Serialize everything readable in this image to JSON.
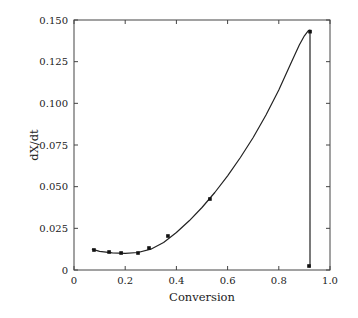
{
  "chart_data": {
    "type": "line",
    "title": "",
    "xlabel": "Conversion",
    "ylabel": "dX/dt",
    "xlim": [
      0,
      1.0
    ],
    "ylim": [
      0,
      0.15
    ],
    "grid": false,
    "legend": null,
    "x_ticks": [
      0,
      0.2,
      0.4,
      0.6,
      0.8,
      1.0
    ],
    "x_tick_labels": [
      "0",
      "0.2",
      "0.4",
      "0.6",
      "0.8",
      "1.0"
    ],
    "y_ticks": [
      0,
      0.025,
      0.05,
      0.075,
      0.1,
      0.125,
      0.15
    ],
    "y_tick_labels": [
      "0",
      "0.025",
      "0.050",
      "0.075",
      "0.100",
      "0.125",
      "0.150"
    ],
    "series": [
      {
        "name": "experimental",
        "style": "markers",
        "x": [
          0.078,
          0.137,
          0.184,
          0.25,
          0.293,
          0.367,
          0.531,
          0.918,
          0.922
        ],
        "y": [
          0.012,
          0.0108,
          0.0102,
          0.0102,
          0.0132,
          0.0204,
          0.0426,
          0.0024,
          0.143
        ]
      },
      {
        "name": "model fit",
        "style": "line",
        "x": [
          0.07,
          0.1,
          0.15,
          0.2,
          0.25,
          0.3,
          0.35,
          0.4,
          0.45,
          0.5,
          0.55,
          0.6,
          0.65,
          0.7,
          0.75,
          0.8,
          0.85,
          0.88,
          0.9,
          0.915,
          0.922,
          0.922
        ],
        "y": [
          0.0125,
          0.0112,
          0.0103,
          0.01,
          0.0105,
          0.0125,
          0.0165,
          0.0225,
          0.0295,
          0.0375,
          0.0465,
          0.0565,
          0.0675,
          0.0795,
          0.093,
          0.108,
          0.125,
          0.135,
          0.1405,
          0.1435,
          0.144,
          0.0015
        ]
      }
    ]
  }
}
